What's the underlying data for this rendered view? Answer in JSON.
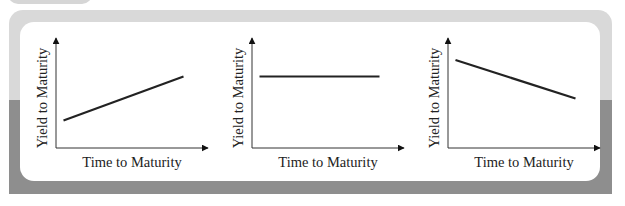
{
  "chart_data": [
    {
      "type": "line",
      "title": "",
      "xlabel": "Time to Maturity",
      "ylabel": "Yield to Maturity",
      "description": "Upward sloping yield curve",
      "series": [
        {
          "name": "yield-curve",
          "x": [
            0.05,
            0.85
          ],
          "y": [
            0.25,
            0.65
          ]
        }
      ],
      "xlim": [
        0,
        1
      ],
      "ylim": [
        0,
        1
      ],
      "grid": false,
      "legend": "none"
    },
    {
      "type": "line",
      "title": "",
      "xlabel": "Time to Maturity",
      "ylabel": "Yield to Maturity",
      "description": "Flat yield curve",
      "series": [
        {
          "name": "yield-curve",
          "x": [
            0.05,
            0.85
          ],
          "y": [
            0.65,
            0.65
          ]
        }
      ],
      "xlim": [
        0,
        1
      ],
      "ylim": [
        0,
        1
      ],
      "grid": false,
      "legend": "none"
    },
    {
      "type": "line",
      "title": "",
      "xlabel": "Time to Maturity",
      "ylabel": "Yield to Maturity",
      "description": "Downward sloping (inverted) yield curve",
      "series": [
        {
          "name": "yield-curve",
          "x": [
            0.05,
            0.85
          ],
          "y": [
            0.8,
            0.45
          ]
        }
      ],
      "xlim": [
        0,
        1
      ],
      "ylim": [
        0,
        1
      ],
      "grid": false,
      "legend": "none"
    }
  ],
  "colors": {
    "line": "#222222",
    "frame_light": "#d9d9d9",
    "frame_dark": "#8e8e8e",
    "card": "#ffffff"
  }
}
